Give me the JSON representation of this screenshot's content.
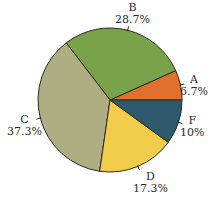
{
  "chart_data": {
    "type": "pie",
    "title": "",
    "start_angle_deg": 0,
    "direction": "counterclockwise",
    "slices": [
      {
        "label": "A",
        "value": 6.7,
        "value_label": "6.7%",
        "color": "#e0702e"
      },
      {
        "label": "B",
        "value": 28.7,
        "value_label": "28.7%",
        "color": "#79a34a"
      },
      {
        "label": "C",
        "value": 37.3,
        "value_label": "37.3%",
        "color": "#aeae82"
      },
      {
        "label": "D",
        "value": 17.3,
        "value_label": "17.3%",
        "color": "#f0cc4a"
      },
      {
        "label": "F",
        "value": 10,
        "value_label": "10%",
        "color": "#2f5a6e"
      }
    ],
    "outline_color": "#2b2a1a",
    "legend": "none (labels placed outside slices with leader ticks)"
  }
}
